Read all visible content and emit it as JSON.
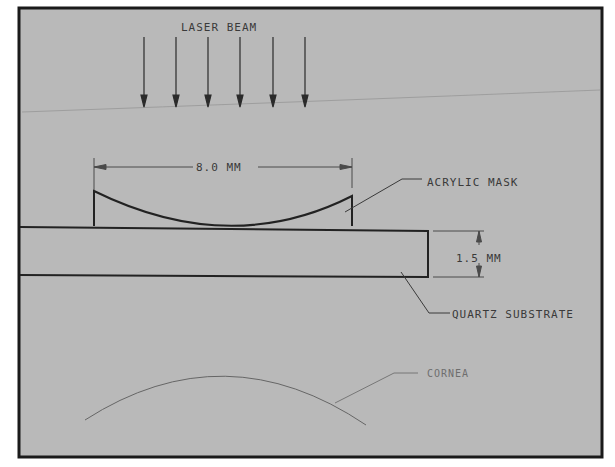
{
  "figure": {
    "type": "technical-drawing",
    "background_color": "#b9b9b9",
    "frame_color": "#1a1a1a",
    "line_color": "#2b2b2b"
  },
  "labels": {
    "laser_beam": "LASER BEAM",
    "mask_width": "8.0 MM",
    "acrylic_mask": "ACRYLIC MASK",
    "substrate_thickness": "1.5 MM",
    "quartz_substrate": "QUARTZ SUBSTRATE",
    "cornea": "CORNEA"
  },
  "laser_beam": {
    "arrow_count": 6
  },
  "dimensions": [
    {
      "name": "mask-width",
      "value": "8.0 MM"
    },
    {
      "name": "substrate-thickness",
      "value": "1.5 MM"
    }
  ]
}
